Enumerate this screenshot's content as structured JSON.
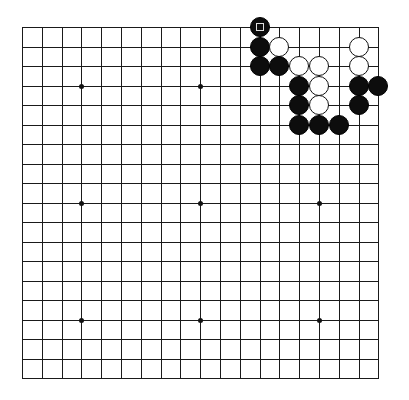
{
  "board": {
    "size": 19,
    "origin_x": 22,
    "origin_y": 27,
    "spacing_x": 19.8,
    "spacing_y": 19.5,
    "line_color": "#1a1a1a",
    "background": "#ffffff",
    "star_points": [
      [
        3,
        3
      ],
      [
        9,
        3
      ],
      [
        3,
        9
      ],
      [
        9,
        9
      ],
      [
        15,
        9
      ],
      [
        3,
        15
      ],
      [
        9,
        15
      ],
      [
        15,
        15
      ],
      [
        15,
        3
      ]
    ],
    "stones": [
      {
        "col": 12,
        "row": 0,
        "color": "black",
        "marker": "square",
        "last_move": true
      },
      {
        "col": 12,
        "row": 1,
        "color": "black"
      },
      {
        "col": 13,
        "row": 1,
        "color": "white"
      },
      {
        "col": 17,
        "row": 1,
        "color": "white"
      },
      {
        "col": 12,
        "row": 2,
        "color": "black"
      },
      {
        "col": 13,
        "row": 2,
        "color": "black"
      },
      {
        "col": 14,
        "row": 2,
        "color": "white"
      },
      {
        "col": 15,
        "row": 2,
        "color": "white"
      },
      {
        "col": 17,
        "row": 2,
        "color": "white"
      },
      {
        "col": 14,
        "row": 3,
        "color": "black"
      },
      {
        "col": 15,
        "row": 3,
        "color": "white"
      },
      {
        "col": 17,
        "row": 3,
        "color": "black"
      },
      {
        "col": 18,
        "row": 3,
        "color": "black"
      },
      {
        "col": 14,
        "row": 4,
        "color": "black"
      },
      {
        "col": 15,
        "row": 4,
        "color": "white"
      },
      {
        "col": 17,
        "row": 4,
        "color": "black"
      },
      {
        "col": 14,
        "row": 5,
        "color": "black"
      },
      {
        "col": 15,
        "row": 5,
        "color": "black"
      },
      {
        "col": 16,
        "row": 5,
        "color": "black"
      }
    ]
  }
}
